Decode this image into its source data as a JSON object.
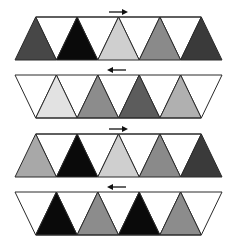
{
  "diagram": {
    "type": "triangle-strip-sequence",
    "rows": [
      {
        "id": "row-1",
        "orientation": "up-strip",
        "arrow": "right",
        "up_triangles": [
          "#474747",
          "#0a0a0a",
          "#cfcfcf",
          "#8a8a8a",
          "#3a3a3a"
        ],
        "down_triangles_fill": "#ffffff"
      },
      {
        "id": "row-2",
        "orientation": "down-strip",
        "arrow": "left",
        "up_triangles": [
          "#e2e2e2",
          "#8c8c8c",
          "#5c5c5c",
          "#b0b0b0"
        ],
        "down_triangles_fill": "#ffffff"
      },
      {
        "id": "row-3",
        "orientation": "up-strip",
        "arrow": "right",
        "up_triangles": [
          "#a8a8a8",
          "#0a0a0a",
          "#cfcfcf",
          "#8a8a8a",
          "#3a3a3a"
        ],
        "down_triangles_fill": "#ffffff"
      },
      {
        "id": "row-4",
        "orientation": "down-strip",
        "arrow": "left",
        "up_triangles": [
          "#0a0a0a",
          "#8c8c8c",
          "#0a0a0a",
          "#8c8c8c"
        ],
        "down_triangles_fill": "#ffffff"
      }
    ],
    "stroke_color": "#2a2a2a",
    "background": "#ffffff"
  }
}
